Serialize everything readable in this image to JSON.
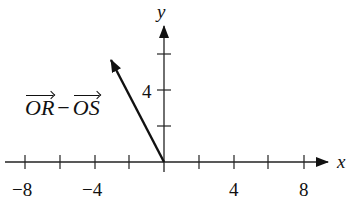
{
  "diagram": {
    "type": "vector-on-coordinate-plane",
    "axes": {
      "x_label": "x",
      "y_label": "y",
      "x_tick_labels": [
        "−8",
        "−4",
        "4",
        "8"
      ],
      "y_tick_labels": [
        "4"
      ],
      "x_ticks": [
        -8,
        -6,
        -4,
        -2,
        2,
        4,
        6,
        8
      ],
      "y_ticks": [
        2,
        4,
        6
      ]
    },
    "vector": {
      "label_part1": "OR",
      "label_op": "−",
      "label_part2": "OS",
      "from": [
        0,
        0
      ],
      "to": [
        -3,
        6
      ]
    }
  }
}
